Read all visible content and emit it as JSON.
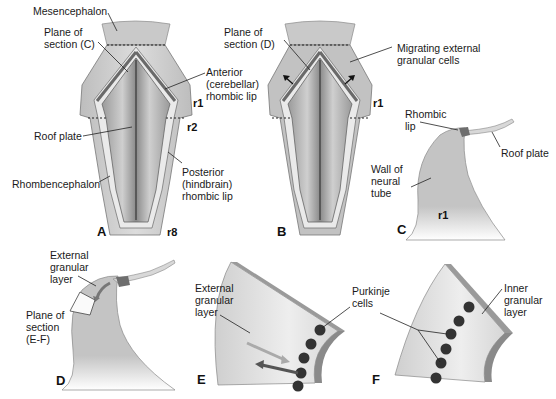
{
  "panels": {
    "A": {
      "letter": "A",
      "labels": {
        "mesencephalon": "Mesencephalon",
        "plane_c": "Plane of\nsection (C)",
        "anterior_lip": "Anterior\n(cerebellar)\nrhombic lip",
        "roof_plate": "Roof plate",
        "rhombencephalon": "Rhombencephalon",
        "posterior_lip": "Posterior\n(hindbrain)\nrhombic lip"
      },
      "rhombomeres": {
        "r1": "r1",
        "r2": "r2",
        "r8": "r8"
      }
    },
    "B": {
      "letter": "B",
      "labels": {
        "plane_d": "Plane of\nsection (D)",
        "migrating": "Migrating external\ngranular cells"
      },
      "rhombomeres": {
        "r1": "r1"
      }
    },
    "C": {
      "letter": "C",
      "labels": {
        "rhombic_lip": "Rhombic\nlip",
        "roof_plate": "Roof plate",
        "wall": "Wall of\nneural\ntube"
      },
      "rhombomeres": {
        "r1": "r1"
      }
    },
    "D": {
      "letter": "D",
      "labels": {
        "egl": "External\ngranular\nlayer",
        "plane_ef": "Plane of\nsection\n(E-F)"
      }
    },
    "E": {
      "letter": "E",
      "labels": {
        "egl": "External\ngranular\nlayer",
        "purkinje": "Purkinje\ncells"
      }
    },
    "F": {
      "letter": "F",
      "labels": {
        "igl": "Inner\ngranular\nlayer"
      }
    }
  },
  "colors": {
    "tissue": "#c8c8c8",
    "tissue_light": "#e4e4e4",
    "tissue_dark": "#8a8a8a",
    "lip_dark": "#6e6e6e",
    "cell": "#333333",
    "text": "#1a1a1a"
  }
}
